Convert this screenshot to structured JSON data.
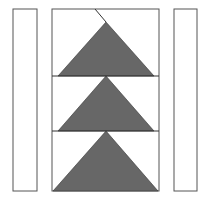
{
  "diagram": {
    "width": 207,
    "height": 199,
    "colors": {
      "stroke": "#555555",
      "fill": "#676767",
      "background": "#ffffff"
    },
    "left_strip": {
      "x": 13,
      "y": 9,
      "w": 24,
      "h": 182
    },
    "right_strip": {
      "x": 174,
      "y": 9,
      "w": 23,
      "h": 182
    },
    "center_box": {
      "x": 52,
      "y": 9,
      "w": 107,
      "h": 182
    },
    "dividers": [
      76,
      131
    ],
    "cut_line": {
      "x1": 95,
      "y1": 9,
      "x2": 106,
      "y2": 22
    },
    "triangles": [
      {
        "apex": [
          106,
          22
        ],
        "left": [
          58,
          76
        ],
        "right": [
          154,
          76
        ]
      },
      {
        "apex": [
          106,
          76
        ],
        "left": [
          58,
          131
        ],
        "right": [
          154,
          131
        ]
      },
      {
        "apex": [
          106,
          131
        ],
        "left": [
          53,
          191
        ],
        "right": [
          158,
          191
        ]
      }
    ]
  }
}
